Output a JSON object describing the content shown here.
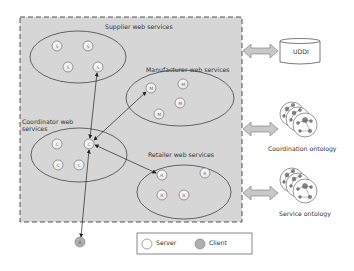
{
  "diagram": {
    "groups": [
      {
        "id": "supplier",
        "label": "Supplier web services",
        "node_letter": "S",
        "node_count": 4
      },
      {
        "id": "manufacturer",
        "label": "Manufacturer web services",
        "node_letter": "M",
        "node_count": 4
      },
      {
        "id": "coordinator",
        "label_line1": "Coordinator web",
        "label_line2": "services",
        "node_letter": "C",
        "node_count": 4
      },
      {
        "id": "retailer",
        "label": "Retailer web services",
        "node_letter": "R",
        "node_count": 4
      }
    ],
    "client": {
      "letter": "B"
    },
    "external": {
      "uddi": {
        "label": "UDDI"
      },
      "coordination_ontology": {
        "label": "Coordination ontology"
      },
      "service_ontology": {
        "label": "Service ontology"
      }
    },
    "legend": {
      "server_label": "Server",
      "client_label": "Client"
    },
    "colors": {
      "container_fill": "#d6d6d6",
      "border": "#555555",
      "server_fill": "#ffffff",
      "client_fill": "#b0b0b0",
      "arrow_fill": "#c8c8c8"
    },
    "edges": [
      {
        "from": "coordinator.C2",
        "to": "supplier.S4"
      },
      {
        "from": "coordinator.C2",
        "to": "manufacturer.M1"
      },
      {
        "from": "coordinator.C2",
        "to": "retailer.R1"
      },
      {
        "from": "coordinator.C2",
        "to": "client.B"
      }
    ]
  }
}
